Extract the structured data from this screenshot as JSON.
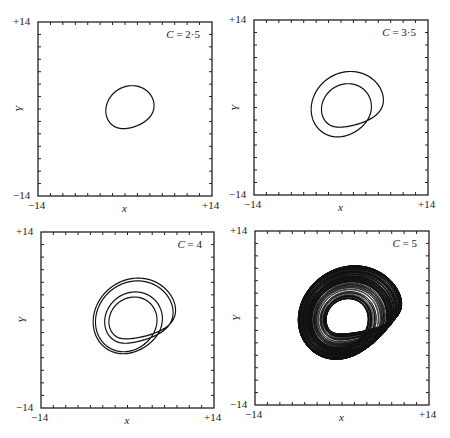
{
  "figure": {
    "axis_min_label": "−14",
    "axis_max_label": "+14",
    "xlabel": "x",
    "ylabel": "Y"
  },
  "panels": [
    {
      "id": "a",
      "c_text": "C = 2·5",
      "c": 2.5,
      "frame": [
        38,
        22,
        174,
        174
      ]
    },
    {
      "id": "b",
      "c_text": "C = 3·5",
      "c": 3.5,
      "frame": [
        254,
        20,
        174,
        175
      ]
    },
    {
      "id": "c",
      "c_text": "C = 4",
      "c": 4.0,
      "frame": [
        41,
        232,
        173,
        176
      ]
    },
    {
      "id": "d",
      "c_text": "C = 5",
      "c": 5.0,
      "frame": [
        255,
        231,
        174,
        174
      ]
    }
  ],
  "chart_data": [
    {
      "type": "line",
      "title": "C = 2·5",
      "xlabel": "x",
      "ylabel": "Y",
      "xlim": [
        -14,
        14
      ],
      "ylim": [
        -14,
        14
      ],
      "ticks_every": 2,
      "description": "period-1 limit cycle",
      "params": {
        "a": 0.2,
        "b": 0.2,
        "c": 2.5
      }
    },
    {
      "type": "line",
      "title": "C = 3·5",
      "xlabel": "x",
      "ylabel": "Y",
      "xlim": [
        -14,
        14
      ],
      "ylim": [
        -14,
        14
      ],
      "ticks_every": 2,
      "description": "period-2 limit cycle",
      "params": {
        "a": 0.2,
        "b": 0.2,
        "c": 3.5
      }
    },
    {
      "type": "line",
      "title": "C = 4",
      "xlabel": "x",
      "ylabel": "Y",
      "xlim": [
        -14,
        14
      ],
      "ylim": [
        -14,
        14
      ],
      "ticks_every": 2,
      "description": "period-4 limit cycle",
      "params": {
        "a": 0.2,
        "b": 0.2,
        "c": 4.0
      }
    },
    {
      "type": "line",
      "title": "C = 5",
      "xlabel": "x",
      "ylabel": "Y",
      "xlim": [
        -14,
        14
      ],
      "ylim": [
        -14,
        14
      ],
      "ticks_every": 2,
      "description": "chaotic attractor",
      "params": {
        "a": 0.2,
        "b": 0.2,
        "c": 5.0
      }
    }
  ]
}
